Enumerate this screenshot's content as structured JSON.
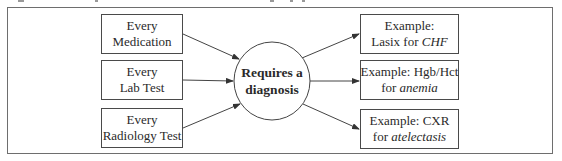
{
  "diagram": {
    "inputs": [
      {
        "line1": "Every",
        "line2": "Medication"
      },
      {
        "line1": "Every",
        "line2": "Lab Test"
      },
      {
        "line1": "Every",
        "line2": "Radiology Test"
      }
    ],
    "center": {
      "line1": "Requires a",
      "line2": "diagnosis"
    },
    "outputs": [
      {
        "line1": "Example:",
        "line2_prefix": "Lasix for ",
        "line2_italic": "CHF"
      },
      {
        "line1": "Example: Hgb/Hct",
        "line2_prefix": "for ",
        "line2_italic": "anemia"
      },
      {
        "line1": "Example: CXR",
        "line2_prefix": "for ",
        "line2_italic": "atelectasis"
      }
    ],
    "colors": {
      "stroke": "#4a4a4a",
      "frame": "#6e6e6e",
      "text": "#2a2a2a"
    }
  }
}
